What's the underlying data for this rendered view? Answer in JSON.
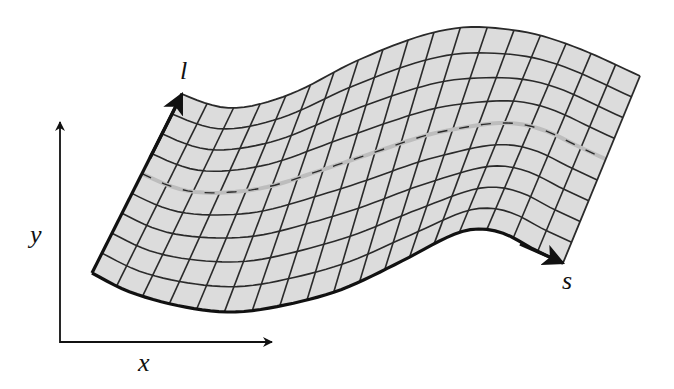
{
  "diagram": {
    "colors": {
      "background": "#ffffff",
      "mesh_fill": "#dcdcdc",
      "mesh_line": "#2a2a2a",
      "boundary": "#111111",
      "centerline": "#bdbdbd",
      "axis": "#111111"
    },
    "labels": {
      "x_axis": "x",
      "y_axis": "y",
      "s_axis": "s",
      "l_axis": "l"
    },
    "label_positions": {
      "x_axis": {
        "left": 138,
        "top": 350
      },
      "y_axis": {
        "left": 30,
        "top": 222
      },
      "s_axis": {
        "left": 562,
        "top": 268
      },
      "l_axis": {
        "left": 180,
        "top": 58
      }
    },
    "axes": {
      "origin": [
        60,
        342
      ],
      "y_end": [
        60,
        122
      ],
      "x_end": [
        272,
        342
      ]
    },
    "mesh": {
      "rows": 9,
      "columns": 18,
      "bottom_edge": [
        [
          92,
          273
        ],
        [
          130,
          292
        ],
        [
          180,
          306
        ],
        [
          230,
          312
        ],
        [
          280,
          306
        ],
        [
          340,
          290
        ],
        [
          400,
          262
        ],
        [
          450,
          236
        ],
        [
          478,
          229
        ],
        [
          505,
          234
        ],
        [
          535,
          250
        ],
        [
          563,
          263
        ]
      ],
      "top_edge": [
        [
          182,
          94
        ],
        [
          205,
          103
        ],
        [
          230,
          108
        ],
        [
          260,
          104
        ],
        [
          300,
          90
        ],
        [
          350,
          64
        ],
        [
          400,
          43
        ],
        [
          440,
          31
        ],
        [
          478,
          27
        ],
        [
          530,
          33
        ],
        [
          580,
          49
        ],
        [
          640,
          76
        ]
      ],
      "centerline_row": 5
    },
    "arrows": {
      "l_arrow": {
        "from": [
          150,
          158
        ],
        "to": [
          182,
          94
        ]
      },
      "s_arrow": {
        "from": [
          520,
          244
        ],
        "to": [
          563,
          263
        ]
      }
    }
  }
}
